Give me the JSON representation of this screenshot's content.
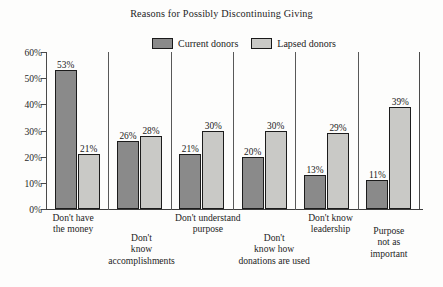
{
  "chart_data": {
    "type": "bar",
    "title": "Reasons for Possibly Discontinuing Giving",
    "xlabel": "",
    "ylabel": "",
    "ylim": [
      0,
      60
    ],
    "ytick_labels": [
      "60%",
      "50%",
      "40%",
      "30%",
      "20%",
      "10%",
      "0%"
    ],
    "ytick_values": [
      60,
      50,
      40,
      30,
      20,
      10,
      0
    ],
    "grid": false,
    "legend_position": "top-center",
    "categories": [
      "Don't have the money",
      "Don't know accomplishments",
      "Don't understand purpose",
      "Don't know how donations are used",
      "Don't know leadership",
      "Purpose not as important"
    ],
    "category_lines": [
      [
        "Don't have",
        "the money"
      ],
      [
        "Don't",
        "know",
        "accomplishments"
      ],
      [
        "Don't understand",
        "purpose"
      ],
      [
        "Don't",
        "know how",
        "donations are used"
      ],
      [
        "Don't know",
        "leadership"
      ],
      [
        "Purpose",
        "not as",
        "important"
      ]
    ],
    "series": [
      {
        "name": "Current donors",
        "color": "#8a8a8a",
        "values": [
          53,
          26,
          21,
          20,
          13,
          11
        ],
        "value_labels": [
          "53%",
          "26%",
          "21%",
          "20%",
          "13%",
          "11%"
        ]
      },
      {
        "name": "Lapsed donors",
        "color": "#c9c9c6",
        "values": [
          21,
          28,
          30,
          30,
          29,
          39
        ],
        "value_labels": [
          "21%",
          "28%",
          "30%",
          "30%",
          "29%",
          "39%"
        ]
      }
    ]
  },
  "legend": {
    "entries": [
      {
        "label": "Current donors",
        "color": "#8a8a8a"
      },
      {
        "label": "Lapsed donors",
        "color": "#c9c9c6"
      }
    ]
  }
}
